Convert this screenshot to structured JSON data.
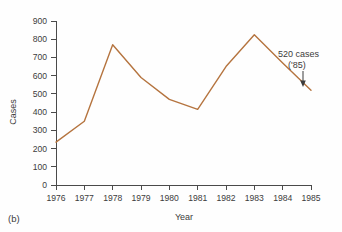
{
  "panel": {
    "label": "(b)"
  },
  "chart_data": {
    "type": "line",
    "title": "",
    "xlabel": "Year",
    "ylabel": "Cases",
    "categories": [
      "1976",
      "1977",
      "1978",
      "1979",
      "1980",
      "1981",
      "1982",
      "1983",
      "1984",
      "1985"
    ],
    "x": [
      1976,
      1977,
      1978,
      1979,
      1980,
      1981,
      1982,
      1983,
      1984,
      1985
    ],
    "values": [
      235,
      350,
      770,
      590,
      470,
      415,
      650,
      825,
      670,
      520
    ],
    "series": [
      {
        "name": "Cases",
        "color": "#b5743f",
        "values": [
          235,
          350,
          770,
          590,
          470,
          415,
          650,
          825,
          670,
          520
        ]
      }
    ],
    "ylim": [
      0,
      900
    ],
    "yticks": [
      0,
      100,
      200,
      300,
      400,
      500,
      600,
      700,
      800,
      900
    ],
    "ytick_labels": [
      "0",
      "100",
      "200",
      "300",
      "400",
      "500",
      "600",
      "700",
      "800",
      "900"
    ],
    "xlim": [
      1976,
      1985
    ],
    "grid": false,
    "legend": "none",
    "annotations": [
      {
        "name": "endpoint-callout",
        "line1": "520 cases",
        "line2": "('85)",
        "points_to_year": 1985,
        "points_to_value": 520
      }
    ]
  },
  "colors": {
    "line": "#b5743f",
    "axis": "#4a4a4a",
    "text": "#3c3c3c",
    "background": "#fefefe"
  }
}
